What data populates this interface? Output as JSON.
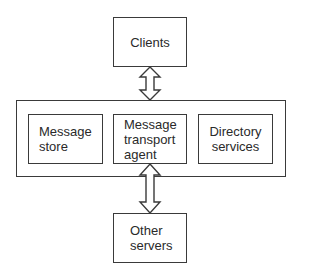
{
  "diagram": {
    "nodes": {
      "clients": {
        "label": "Clients"
      },
      "message_store": {
        "label": "Message\nstore"
      },
      "mta": {
        "label": "Message\ntransport\nagent"
      },
      "directory": {
        "label": "Directory\nservices"
      },
      "other_servers": {
        "label": "Other\nservers"
      }
    },
    "edges": [
      {
        "from": "clients",
        "to": "mta",
        "type": "bidirectional-hollow-arrow"
      },
      {
        "from": "mta",
        "to": "other_servers",
        "type": "bidirectional-hollow-arrow"
      }
    ],
    "colors": {
      "stroke": "#3a3a3a",
      "fill": "#ffffff",
      "text": "#2a2a2a"
    }
  }
}
